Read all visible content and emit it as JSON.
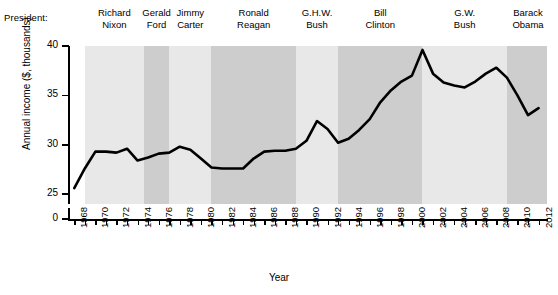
{
  "header": {
    "caption": "President:",
    "presidents": [
      {
        "name_line1": "Richard",
        "name_line2": "Nixon",
        "start": 1969,
        "end": 1974.6
      },
      {
        "name_line1": "Gerald",
        "name_line2": "Ford",
        "start": 1974.6,
        "end": 1977
      },
      {
        "name_line1": "Jimmy",
        "name_line2": "Carter",
        "start": 1977,
        "end": 1981
      },
      {
        "name_line1": "Ronald",
        "name_line2": "Reagan",
        "start": 1981,
        "end": 1989
      },
      {
        "name_line1": "G.H.W.",
        "name_line2": "Bush",
        "start": 1989,
        "end": 1993
      },
      {
        "name_line1": "Bill",
        "name_line2": "Clinton",
        "start": 1993,
        "end": 2001
      },
      {
        "name_line1": "G.W.",
        "name_line2": "Bush",
        "start": 2001,
        "end": 2009
      },
      {
        "name_line1": "Barack",
        "name_line2": "Obama",
        "start": 2009,
        "end": 2013
      }
    ]
  },
  "chart_data": {
    "type": "line",
    "title": "",
    "xlabel": "Year",
    "ylabel": "Annual income ($, thousands)",
    "xlim": [
      1967.5,
      2012.8
    ],
    "ylim": [
      24.0,
      40.0
    ],
    "y_axis_break": true,
    "grid": false,
    "legend": "none",
    "y_ticks": [
      0,
      25,
      30,
      35,
      40
    ],
    "y_tick_labels": [
      "0",
      "25",
      "30",
      "35",
      "40"
    ],
    "x_ticks": [
      1968,
      1969,
      1970,
      1971,
      1972,
      1973,
      1974,
      1975,
      1976,
      1977,
      1978,
      1979,
      1980,
      1981,
      1982,
      1983,
      1984,
      1985,
      1986,
      1987,
      1988,
      1989,
      1990,
      1991,
      1992,
      1993,
      1994,
      1995,
      1996,
      1997,
      1998,
      1999,
      2000,
      2001,
      2002,
      2003,
      2004,
      2005,
      2006,
      2007,
      2008,
      2009,
      2010,
      2011,
      2012
    ],
    "x_tick_labels": [
      "1968",
      "",
      "1970",
      "",
      "1972",
      "",
      "1974",
      "",
      "1976",
      "",
      "1978",
      "",
      "1980",
      "",
      "1982",
      "",
      "1984",
      "",
      "1986",
      "",
      "1988",
      "",
      "1990",
      "",
      "1992",
      "",
      "1994",
      "",
      "1996",
      "",
      "1998",
      "",
      "2000",
      "",
      "2002",
      "",
      "2004",
      "",
      "2006",
      "",
      "2008",
      "",
      "2010",
      "",
      "2012"
    ],
    "series": [
      {
        "name": "Median annual income",
        "color": "#000000",
        "x": [
          1968,
          1969,
          1970,
          1971,
          1972,
          1973,
          1974,
          1975,
          1976,
          1977,
          1978,
          1979,
          1980,
          1981,
          1982,
          1983,
          1984,
          1985,
          1986,
          1987,
          1988,
          1989,
          1990,
          1991,
          1992,
          1993,
          1994,
          1995,
          1996,
          1997,
          1998,
          1999,
          2000,
          2001,
          2002,
          2003,
          2004,
          2005,
          2006,
          2007,
          2008,
          2009,
          2010,
          2011,
          2012
        ],
        "values": [
          25.6,
          27.6,
          29.3,
          29.3,
          29.2,
          29.6,
          28.4,
          28.7,
          29.1,
          29.2,
          29.8,
          29.5,
          28.6,
          27.7,
          27.6,
          27.6,
          27.6,
          28.6,
          29.3,
          29.4,
          29.4,
          29.6,
          30.4,
          32.4,
          31.6,
          30.2,
          30.6,
          31.5,
          32.6,
          34.3,
          35.5,
          36.4,
          37.0,
          39.6,
          37.2,
          36.3,
          36.0,
          35.8,
          36.4,
          37.2,
          37.8,
          36.8,
          35.0,
          33.0,
          33.7
        ]
      }
    ]
  },
  "shading": {
    "light": "#e8e8e8",
    "dark": "#cdcdcd",
    "band_tones": [
      "light",
      "dark",
      "light",
      "dark",
      "light",
      "dark",
      "light",
      "dark"
    ]
  },
  "colors": {
    "line": "#000000",
    "axis": "#000000",
    "background": "#ffffff"
  }
}
